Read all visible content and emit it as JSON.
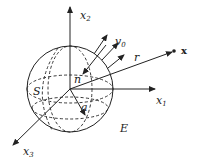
{
  "diagram": {
    "title": "",
    "axes": {
      "x1": {
        "label": "x",
        "sub": "1"
      },
      "x2": {
        "label": "x",
        "sub": "2"
      },
      "x3": {
        "label": "x",
        "sub": "3"
      }
    },
    "labels": {
      "surface": "S",
      "exterior": "E",
      "normal": "n",
      "radius": "a",
      "distance": "r",
      "point": "x",
      "velocity": "v",
      "velocity_sub": "0"
    },
    "colors": {
      "stroke": "#222222",
      "background": "#ffffff"
    }
  }
}
